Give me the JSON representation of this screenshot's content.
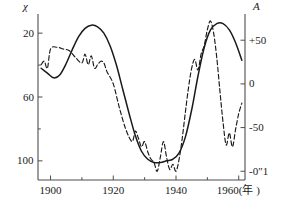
{
  "chart_data": {
    "type": "line",
    "title": "",
    "subtitle": "",
    "xlabel": "年",
    "xlabel_display": "1960(年 )",
    "ylabel_left": "χ",
    "ylabel_right": "A",
    "xlim": [
      1896,
      1962
    ],
    "x_ticks_major": [
      1900,
      1920,
      1940,
      1960
    ],
    "x_tick_labels": [
      "1900",
      "1920",
      "1940",
      "1960"
    ],
    "x_ticks_minor": [
      1910,
      1930,
      1950
    ],
    "y_left_lim": [
      8,
      112
    ],
    "y_left_inverted": true,
    "y_left_ticks": [
      20,
      60,
      100
    ],
    "y_left_tick_labels": [
      "20",
      "60",
      "100"
    ],
    "y_left_ticks_minor": [
      40,
      80
    ],
    "y_right_lim": [
      -110,
      80
    ],
    "y_right_ticks": [
      50,
      0,
      -50,
      -100
    ],
    "y_right_tick_labels": [
      "+50",
      "0",
      "-50",
      "-0″1"
    ],
    "grid": false,
    "legend_position": "none",
    "series": [
      {
        "name": "smooth-solid-curve",
        "style": "solid",
        "color": "#1a1a1a",
        "axis": "left",
        "x": [
          1897,
          1899,
          1901,
          1903,
          1905,
          1907,
          1909,
          1911,
          1913,
          1915,
          1917,
          1919,
          1921,
          1923,
          1925,
          1927,
          1929,
          1931,
          1933,
          1935,
          1937,
          1939,
          1941,
          1943,
          1945,
          1947,
          1949,
          1951,
          1953,
          1955,
          1957,
          1959,
          1961
        ],
        "values": [
          42,
          45,
          48,
          46,
          39,
          30,
          22,
          17,
          15,
          16,
          20,
          28,
          40,
          55,
          70,
          84,
          94,
          99,
          101,
          101,
          100,
          99,
          95,
          85,
          68,
          47,
          29,
          18,
          14,
          14,
          18,
          26,
          37
        ]
      },
      {
        "name": "oscillating-dashed-curve",
        "style": "dashed",
        "color": "#1a1a1a",
        "axis": "right",
        "x": [
          1897,
          1898,
          1899,
          1900,
          1902,
          1904,
          1906,
          1908,
          1910,
          1911,
          1912,
          1913,
          1914,
          1915,
          1916,
          1917,
          1918,
          1920,
          1922,
          1924,
          1926,
          1927,
          1928,
          1929,
          1930,
          1931,
          1932,
          1933,
          1934,
          1935,
          1936,
          1937,
          1938,
          1939,
          1940,
          1941,
          1942,
          1943,
          1944,
          1945,
          1946,
          1947,
          1948,
          1949,
          1950,
          1951,
          1952,
          1953,
          1954,
          1955,
          1956,
          1957,
          1958,
          1959,
          1960,
          1961
        ],
        "values": [
          22,
          26,
          18,
          40,
          42,
          40,
          38,
          30,
          24,
          34,
          22,
          32,
          18,
          22,
          26,
          24,
          14,
          0,
          -28,
          -52,
          -66,
          -54,
          -62,
          -72,
          -66,
          -78,
          -86,
          -90,
          -100,
          -84,
          -66,
          -84,
          -98,
          -92,
          -100,
          -86,
          -62,
          -32,
          -4,
          18,
          28,
          16,
          34,
          44,
          62,
          72,
          58,
          30,
          -8,
          -44,
          -70,
          -56,
          -72,
          -52,
          -34,
          -22
        ]
      }
    ],
    "annotations": []
  },
  "axes": {
    "left_title": "χ",
    "right_title": "A",
    "x_unit_suffix": "(年 )"
  },
  "colors": {
    "background": "#ffffff",
    "axis": "#4d4d4d",
    "line": "#1a1a1a",
    "text": "#1a1a1a"
  }
}
